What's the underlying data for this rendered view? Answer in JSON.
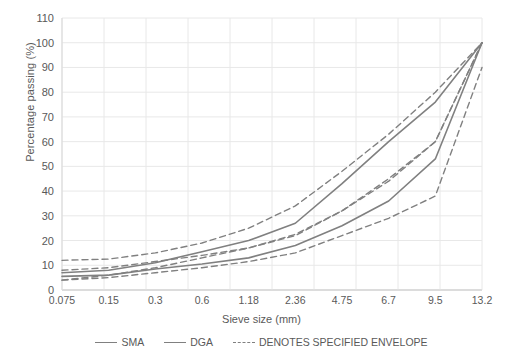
{
  "chart_data": {
    "type": "line",
    "title": "",
    "xlabel": "Sieve size (mm)",
    "ylabel": "Percentage passing (%)",
    "categories": [
      "0.075",
      "0.15",
      "0.3",
      "0.6",
      "1.18",
      "2.36",
      "4.75",
      "6.7",
      "9.5",
      "13.2"
    ],
    "ylim": [
      0,
      110
    ],
    "yticks": [
      "0",
      "10",
      "20",
      "30",
      "40",
      "50",
      "60",
      "70",
      "80",
      "90",
      "100",
      "110"
    ],
    "grid": true,
    "legend_position": "bottom",
    "series": [
      {
        "name": "SMA",
        "style": "solid",
        "color": "#808080",
        "values": [
          7,
          8,
          11,
          15.5,
          20,
          27,
          43,
          60,
          76,
          100
        ]
      },
      {
        "name": "DGA",
        "style": "solid",
        "color": "#808080",
        "values": [
          5.5,
          6,
          8.5,
          10.5,
          13,
          18,
          26,
          36,
          53,
          100
        ]
      },
      {
        "name": "SMA upper envelope",
        "style": "dashed",
        "color": "#808080",
        "values": [
          12,
          12.5,
          15,
          19,
          25,
          34,
          48,
          63,
          80,
          100
        ]
      },
      {
        "name": "SMA lower envelope",
        "style": "dashed",
        "color": "#808080",
        "values": [
          4,
          6,
          9,
          13,
          17,
          22,
          32,
          45,
          60,
          100
        ]
      },
      {
        "name": "DGA upper envelope",
        "style": "dashed",
        "color": "#808080",
        "values": [
          8,
          9,
          11.5,
          14,
          17,
          22.5,
          32,
          44,
          60,
          100
        ]
      },
      {
        "name": "DGA lower envelope",
        "style": "dashed",
        "color": "#808080",
        "values": [
          4,
          5,
          7,
          9,
          11.5,
          15,
          22,
          29,
          38,
          90
        ]
      }
    ],
    "legend": [
      {
        "label": "SMA",
        "style": "solid"
      },
      {
        "label": "DGA",
        "style": "solid"
      },
      {
        "label": "DENOTES SPECIFIED ENVELOPE",
        "style": "dashed"
      }
    ]
  }
}
